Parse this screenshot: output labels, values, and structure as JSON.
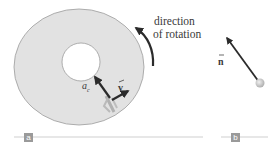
{
  "figure": {
    "panel_a": {
      "tag": "a",
      "rotation_label_line1": "direction",
      "rotation_label_line2": "of rotation",
      "accel_label": "a",
      "accel_subscript": "c",
      "velocity_label": "v"
    },
    "panel_b": {
      "tag": "b",
      "normal_label": "n"
    },
    "colors": {
      "disk_fill": "#e2e2e2",
      "disk_edge": "#9c9c9c",
      "arrow": "#2b2b2b",
      "tag_bg": "#9a9a9a",
      "rule": "#cfcfcf",
      "ball": "#c8c8c8"
    }
  }
}
